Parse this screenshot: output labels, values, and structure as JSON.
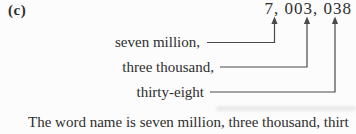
{
  "part_label": "(c)",
  "numeral": "7, 003, 038",
  "annotations": [
    {
      "label": "seven million,",
      "points_to_digits": "7"
    },
    {
      "label": "three thousand,",
      "points_to_digits": "003"
    },
    {
      "label": "thirty-eight",
      "points_to_digits": "038"
    }
  ],
  "caption": "The word name is seven million, three thousand, thirt",
  "colors": {
    "ink": "#2e2e2e",
    "connector_line": "#4a4a4a",
    "background": "#fcfcfc"
  }
}
